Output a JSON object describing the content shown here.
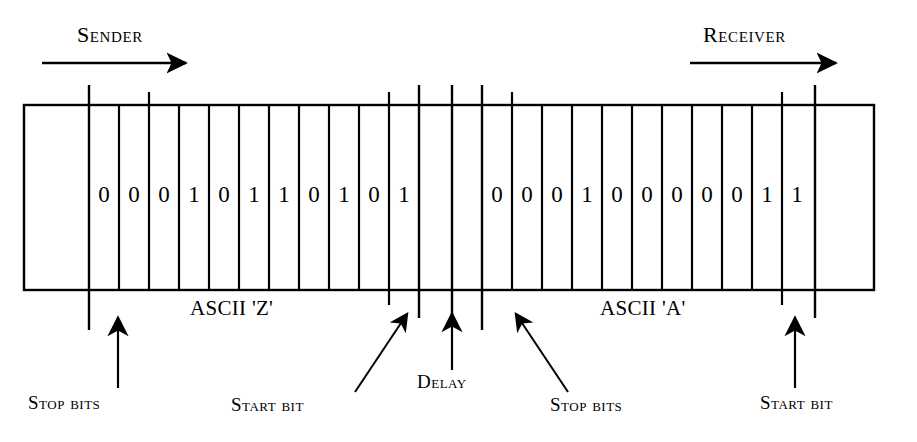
{
  "figure": {
    "background": "#ffffff",
    "ink": "#000000"
  },
  "direction_labels": {
    "sender": "Sender",
    "receiver": "Receiver"
  },
  "frames": [
    {
      "id": "frame-z",
      "caption": "ASCII 'Z'",
      "bits": [
        "0",
        "0",
        "0",
        "1",
        "0",
        "1",
        "1",
        "0",
        "1",
        "0",
        "1"
      ]
    },
    {
      "id": "frame-a",
      "caption": "ASCII 'A'",
      "bits": [
        "0",
        "0",
        "0",
        "1",
        "0",
        "0",
        "0",
        "0",
        "0",
        "1",
        "1"
      ]
    }
  ],
  "annotations": [
    {
      "id": "stop-bits-left",
      "label": "Stop bits",
      "arrow": "vertical"
    },
    {
      "id": "start-bit-left",
      "label": "Start bit",
      "arrow": "diagonal-up-right"
    },
    {
      "id": "delay",
      "label": "Delay",
      "arrow": "vertical"
    },
    {
      "id": "stop-bits-right",
      "label": "Stop bits",
      "arrow": "diagonal-up-left"
    },
    {
      "id": "start-bit-right",
      "label": "Start bit",
      "arrow": "vertical"
    }
  ],
  "bit_values_z_joined": "00010110101",
  "bit_values_a_joined": "00010000011"
}
